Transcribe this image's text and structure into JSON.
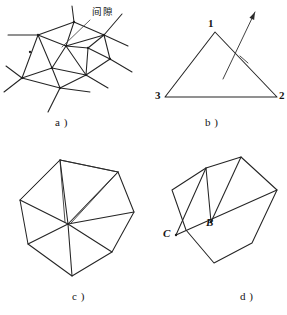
{
  "figure": {
    "background": "#ffffff",
    "ink": "#242424",
    "panels": [
      {
        "id": "a",
        "caption": "a )",
        "caption_pos": [
          55,
          117
        ],
        "annotation": {
          "text": "间隙",
          "pos": [
            92,
            7
          ],
          "leader": [
            [
              90,
              20
            ],
            [
              62,
              47
            ]
          ]
        },
        "nodes": [
          [
            38,
            35
          ],
          [
            74,
            22
          ],
          [
            104,
            35
          ],
          [
            110,
            59
          ],
          [
            86,
            75
          ],
          [
            52,
            68
          ],
          [
            30,
            52
          ],
          [
            66,
            46
          ],
          [
            88,
            48
          ],
          [
            60,
            88
          ],
          [
            22,
            78
          ]
        ],
        "edges": [
          [
            [
              38,
              35
            ],
            [
              74,
              22
            ]
          ],
          [
            [
              74,
              22
            ],
            [
              104,
              35
            ]
          ],
          [
            [
              104,
              35
            ],
            [
              110,
              59
            ]
          ],
          [
            [
              110,
              59
            ],
            [
              86,
              75
            ]
          ],
          [
            [
              86,
              75
            ],
            [
              60,
              88
            ]
          ],
          [
            [
              60,
              88
            ],
            [
              22,
              78
            ]
          ],
          [
            [
              22,
              78
            ],
            [
              38,
              35
            ]
          ],
          [
            [
              38,
              35
            ],
            [
              66,
              46
            ]
          ],
          [
            [
              74,
              22
            ],
            [
              66,
              46
            ]
          ],
          [
            [
              66,
              46
            ],
            [
              104,
              35
            ]
          ],
          [
            [
              66,
              46
            ],
            [
              88,
              48
            ]
          ],
          [
            [
              88,
              48
            ],
            [
              104,
              35
            ]
          ],
          [
            [
              88,
              48
            ],
            [
              110,
              59
            ]
          ],
          [
            [
              88,
              48
            ],
            [
              86,
              75
            ]
          ],
          [
            [
              66,
              46
            ],
            [
              52,
              68
            ]
          ],
          [
            [
              52,
              68
            ],
            [
              86,
              75
            ]
          ],
          [
            [
              52,
              68
            ],
            [
              22,
              78
            ]
          ],
          [
            [
              52,
              68
            ],
            [
              60,
              88
            ]
          ],
          [
            [
              38,
              35
            ],
            [
              52,
              68
            ]
          ],
          [
            [
              66,
              46
            ],
            [
              86,
              75
            ]
          ]
        ],
        "stubs": [
          [
            [
              74,
              22
            ],
            [
              72,
              6
            ]
          ],
          [
            [
              38,
              35
            ],
            [
              8,
              35
            ]
          ],
          [
            [
              104,
              35
            ],
            [
              122,
              14
            ]
          ],
          [
            [
              104,
              35
            ],
            [
              128,
              46
            ]
          ],
          [
            [
              110,
              59
            ],
            [
              132,
              72
            ]
          ],
          [
            [
              86,
              75
            ],
            [
              108,
              88
            ]
          ],
          [
            [
              60,
              88
            ],
            [
              90,
              92
            ]
          ],
          [
            [
              60,
              88
            ],
            [
              48,
              112
            ]
          ],
          [
            [
              22,
              78
            ],
            [
              4,
              92
            ]
          ],
          [
            [
              22,
              78
            ],
            [
              6,
              66
            ]
          ]
        ]
      },
      {
        "id": "b",
        "caption": "b )",
        "caption_pos": [
          205,
          117
        ],
        "triangle": {
          "vertices": [
            [
              215,
              32
            ],
            [
              277,
              97
            ],
            [
              165,
              97
            ]
          ],
          "labels": [
            {
              "text": "1",
              "pos": [
                208,
                18
              ]
            },
            {
              "text": "2",
              "pos": [
                279,
                90
              ]
            },
            {
              "text": "3",
              "pos": [
                155,
                90
              ]
            }
          ]
        },
        "arrow": {
          "from": [
            223,
            79
          ],
          "to": [
            255,
            12
          ],
          "tick": [
            [
              240,
              56
            ],
            [
              248,
              63
            ]
          ]
        }
      },
      {
        "id": "c",
        "caption": "c )",
        "caption_pos": [
          72,
          291
        ],
        "center": [
          68,
          224
        ],
        "outline": [
          [
            60,
            160
          ],
          [
            118,
            172
          ],
          [
            134,
            212
          ],
          [
            112,
            252
          ],
          [
            72,
            276
          ],
          [
            28,
            244
          ],
          [
            20,
            200
          ]
        ],
        "spokes": [
          [
            60,
            160
          ],
          [
            118,
            172
          ],
          [
            134,
            212
          ],
          [
            112,
            252
          ],
          [
            72,
            276
          ],
          [
            28,
            244
          ],
          [
            20,
            200
          ]
        ],
        "extra_edges": [
          [
            [
              60,
              160
            ],
            [
              20,
              200
            ]
          ],
          [
            [
              60,
              160
            ],
            [
              118,
              172
            ]
          ]
        ]
      },
      {
        "id": "d",
        "caption": "d )",
        "caption_pos": [
          240,
          291
        ],
        "outline": [
          [
            241,
            157
          ],
          [
            277,
            190
          ],
          [
            252,
            243
          ],
          [
            214,
            263
          ],
          [
            186,
            230
          ],
          [
            172,
            190
          ],
          [
            206,
            168
          ]
        ],
        "labels": [
          {
            "text": "C",
            "pos": [
              163,
              228
            ]
          },
          {
            "text": "B",
            "pos": [
              206,
              217
            ]
          }
        ],
        "points": {
          "B": [
            211,
            222
          ],
          "C": [
            176,
            235
          ]
        },
        "chords": [
          [
            [
              176,
              235
            ],
            [
              277,
              190
            ]
          ],
          [
            [
              211,
              222
            ],
            [
              241,
              157
            ]
          ],
          [
            [
              211,
              222
            ],
            [
              206,
              168
            ]
          ],
          [
            [
              176,
              235
            ],
            [
              206,
              168
            ]
          ]
        ]
      }
    ]
  }
}
